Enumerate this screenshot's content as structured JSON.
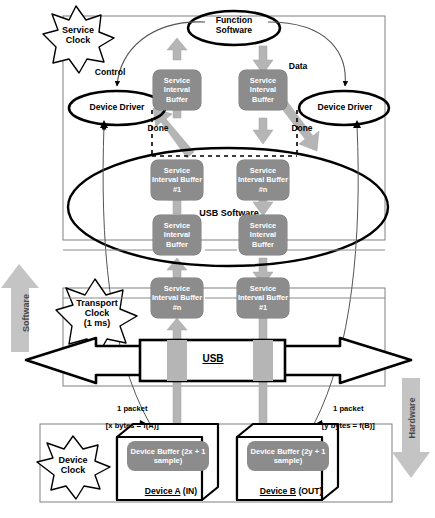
{
  "diagram": {
    "clocks": {
      "service": "Service\nClock",
      "transport": "Transport\nClock\n(1 ms)",
      "device": "Device\nClock"
    },
    "domain_arrows": {
      "software": "Software",
      "hardware": "Hardware"
    },
    "nodes": {
      "function_software": "Function\nSoftware",
      "device_driver_left": "Device Driver",
      "device_driver_right": "Device Driver",
      "usb_software": "USB Software",
      "usb_bus": "USB"
    },
    "edge_labels": {
      "control": "Control",
      "data": "Data",
      "done_left": "Done",
      "done_right": "Done",
      "packet_left_line1": "1 packet",
      "packet_left_line2": "[x bytes = f(A)]",
      "packet_right_line1": "1 packet",
      "packet_right_line2": "[y bytes = f(B)]"
    },
    "buffers": [
      {
        "id": "sib-top-left",
        "label": "Service\nInterval\nBuffer"
      },
      {
        "id": "sib-top-right",
        "label": "Service\nInterval\nBuffer"
      },
      {
        "id": "sib-usb-left-1",
        "label": "Service\nInterval\nBuffer #1"
      },
      {
        "id": "sib-usb-right-n",
        "label": "Service\nInterval\nBuffer #n"
      },
      {
        "id": "sib-usb-left-2",
        "label": "Service\nInterval\nBuffer"
      },
      {
        "id": "sib-usb-right-2",
        "label": "Service\nInterval\nBuffer"
      },
      {
        "id": "sib-xport-left-n",
        "label": "Service\nInterval\nBuffer #n"
      },
      {
        "id": "sib-xport-right-1",
        "label": "Service\nInterval\nBuffer #1"
      }
    ],
    "devices": [
      {
        "id": "device-a",
        "buffer": "Device Buffer\n(2x + 1 sample)",
        "name": "Device A",
        "direction": "(IN)"
      },
      {
        "id": "device-b",
        "buffer": "Device Buffer\n(2y + 1 sample)",
        "name": "Device B",
        "direction": "(OUT)"
      }
    ],
    "colors": {
      "buffer_fill": "#8c8c8c",
      "arrow_fill": "#b3b3b3",
      "line": "#000000",
      "thin_line": "#808080",
      "background": "#ffffff"
    }
  }
}
